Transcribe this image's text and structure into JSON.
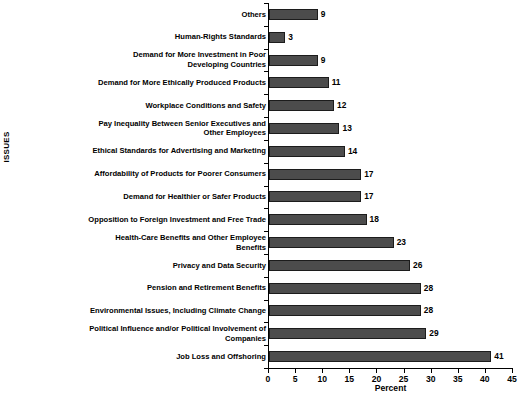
{
  "chart_data": {
    "type": "bar",
    "orientation": "horizontal",
    "title": "",
    "xlabel": "Percent",
    "ylabel": "ISSUES",
    "xlim": [
      0,
      45
    ],
    "xticks": [
      0,
      5,
      10,
      15,
      20,
      25,
      30,
      35,
      40,
      45
    ],
    "grid": false,
    "legend": false,
    "bar_color": "#4c4c4c",
    "bar_edge_color": "#1c1c1c",
    "categories": [
      "Others",
      "Human-Rights Standards",
      "Demand for More Investment in Poor\nDeveloping Countries",
      "Demand for More Ethically Produced Products",
      "Workplace Conditions and Safety",
      "Pay Inequality Between Senior Executives and\nOther Employees",
      "Ethical Standards for Advertising and Marketing",
      "Affordability of Products for Poorer Consumers",
      "Demand for Healthier or Safer Products",
      "Opposition to Foreign Investment and Free Trade",
      "Health-Care Benefits and Other Employee\nBenefits",
      "Privacy and Data Security",
      "Pension and Retirement Benefits",
      "Environmental Issues, Including Climate Change",
      "Political Influence and/or Political Involvement of\nCompanies",
      "Job Loss and Offshoring"
    ],
    "values": [
      9,
      3,
      9,
      11,
      12,
      13,
      14,
      17,
      17,
      18,
      23,
      26,
      28,
      28,
      29,
      41
    ],
    "value_labels": [
      "9",
      "3",
      "9",
      "11",
      "12",
      "13",
      "14",
      "17",
      "17",
      "18",
      "23",
      "26",
      "28",
      "28",
      "29",
      "41"
    ]
  }
}
